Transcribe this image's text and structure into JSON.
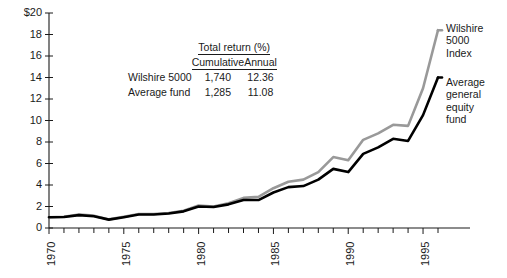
{
  "chart_data": {
    "type": "line",
    "title": "",
    "xlabel": "",
    "ylabel": "",
    "xlim": [
      1970,
      1996
    ],
    "ylim": [
      0,
      20
    ],
    "ytick_values": [
      0,
      2,
      4,
      6,
      8,
      10,
      12,
      14,
      16,
      18,
      20
    ],
    "ytick_labels": [
      "0",
      "2",
      "4",
      "6",
      "8",
      "10",
      "12",
      "14",
      "16",
      "18",
      "$20"
    ],
    "xtick_values": [
      1970,
      1975,
      1980,
      1985,
      1990,
      1995
    ],
    "xtick_labels": [
      "1970",
      "1975",
      "1980",
      "1985",
      "1990",
      "1995"
    ],
    "minor_xticks_every": 1,
    "grid": false,
    "legend_position": "right-of-plot",
    "x": [
      1970,
      1971,
      1972,
      1973,
      1974,
      1975,
      1976,
      1977,
      1978,
      1979,
      1980,
      1981,
      1982,
      1983,
      1984,
      1985,
      1986,
      1987,
      1988,
      1989,
      1990,
      1991,
      1992,
      1993,
      1994,
      1995,
      1996
    ],
    "series": [
      {
        "name": "Wilshire 5000 Index",
        "color": "#999999",
        "values": [
          1.0,
          1.05,
          1.25,
          1.15,
          0.8,
          1.05,
          1.3,
          1.3,
          1.4,
          1.6,
          2.1,
          2.0,
          2.3,
          2.8,
          2.9,
          3.7,
          4.3,
          4.5,
          5.2,
          6.6,
          6.3,
          8.2,
          8.8,
          9.6,
          9.5,
          13.0,
          18.4
        ]
      },
      {
        "name": "Average general equity fund",
        "color": "#000000",
        "values": [
          1.0,
          1.03,
          1.2,
          1.1,
          0.78,
          1.0,
          1.25,
          1.25,
          1.35,
          1.55,
          2.0,
          1.95,
          2.2,
          2.6,
          2.6,
          3.3,
          3.8,
          3.9,
          4.5,
          5.5,
          5.2,
          6.9,
          7.5,
          8.3,
          8.1,
          10.5,
          14.0
        ]
      }
    ]
  },
  "table": {
    "title": "Total return (%)",
    "columns": [
      "Cumulative",
      "Annual"
    ],
    "rows": [
      {
        "label": "Wilshire 5000",
        "cumulative": "1,740",
        "annual": "12.36"
      },
      {
        "label": "Average fund",
        "cumulative": "1,285",
        "annual": "11.08"
      }
    ]
  },
  "series_labels": {
    "wilshire": "Wilshire\n5000\nIndex",
    "average_fund": "Average\ngeneral\nequity\nfund"
  },
  "colors": {
    "wilshire_line": "#999999",
    "average_fund_line": "#000000",
    "axis": "#1a1a1a",
    "background": "#ffffff"
  }
}
